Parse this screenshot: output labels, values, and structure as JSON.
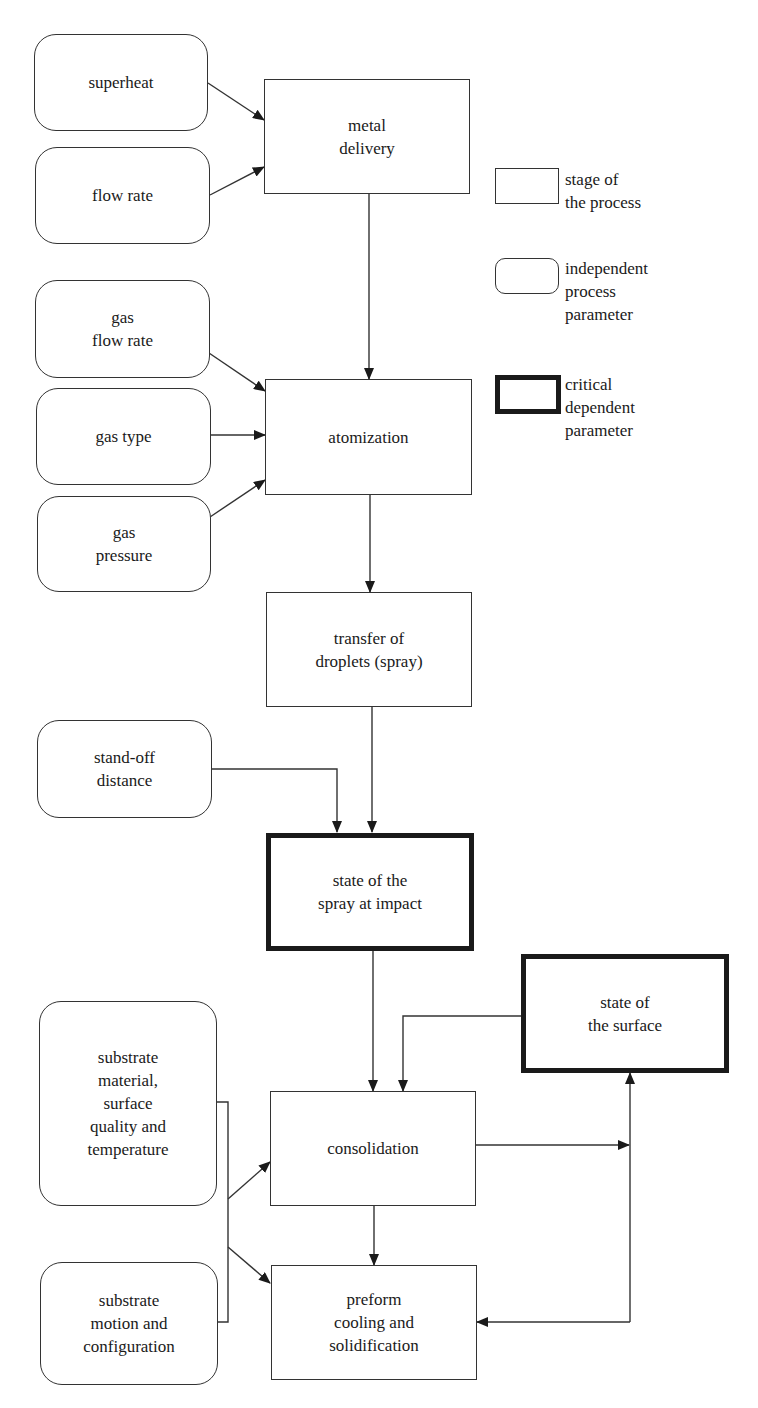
{
  "diagram": {
    "type": "process-flow",
    "nodes": {
      "superheat": "superheat",
      "flow_rate": "flow rate",
      "metal_delivery": "metal\ndelivery",
      "gas_flow_rate": "gas\nflow rate",
      "gas_type": "gas type",
      "gas_pressure": "gas\npressure",
      "atomization": "atomization",
      "transfer": "transfer of\ndroplets (spray)",
      "standoff": "stand-off\ndistance",
      "spray_impact": "state of the\nspray at impact",
      "surface_state": "state of\nthe surface",
      "substrate_material": "substrate\nmaterial,\nsurface\nquality and\ntemperature",
      "substrate_motion": "substrate\nmotion and\nconfiguration",
      "consolidation": "consolidation",
      "preform": "preform\ncooling and\nsolidification"
    },
    "edges": [
      {
        "from": "superheat",
        "to": "metal_delivery"
      },
      {
        "from": "flow_rate",
        "to": "metal_delivery"
      },
      {
        "from": "metal_delivery",
        "to": "atomization"
      },
      {
        "from": "gas_flow_rate",
        "to": "atomization"
      },
      {
        "from": "gas_type",
        "to": "atomization"
      },
      {
        "from": "gas_pressure",
        "to": "atomization"
      },
      {
        "from": "atomization",
        "to": "transfer"
      },
      {
        "from": "transfer",
        "to": "spray_impact"
      },
      {
        "from": "standoff",
        "to": "spray_impact"
      },
      {
        "from": "spray_impact",
        "to": "consolidation"
      },
      {
        "from": "surface_state",
        "to": "consolidation"
      },
      {
        "from": "substrate_material+substrate_motion",
        "to": "consolidation"
      },
      {
        "from": "substrate_material+substrate_motion",
        "to": "preform"
      },
      {
        "from": "consolidation",
        "to": "preform"
      },
      {
        "from": "consolidation",
        "to": "surface_state"
      },
      {
        "from": "surface_state",
        "to": "preform"
      }
    ]
  },
  "legend": {
    "stage": "stage of\nthe process",
    "independent": "independent\nprocess\nparameter",
    "critical": "critical\ndependent\nparameter"
  },
  "colors": {
    "line": "#333333",
    "text": "#1a1a1a",
    "background": "#ffffff"
  }
}
